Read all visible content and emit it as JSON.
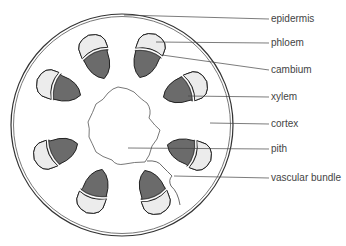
{
  "diagram": {
    "labels": [
      {
        "id": "epidermis",
        "text": "epidermis",
        "y": 19
      },
      {
        "id": "phloem",
        "text": "phloem",
        "y": 43
      },
      {
        "id": "cambium",
        "text": "cambium",
        "y": 70
      },
      {
        "id": "xylem",
        "text": "xylem",
        "y": 97
      },
      {
        "id": "cortex",
        "text": "cortex",
        "y": 124
      },
      {
        "id": "pith",
        "text": "pith",
        "y": 149
      },
      {
        "id": "vascular_bundle",
        "text": "vascular bundle",
        "y": 178
      }
    ],
    "colors": {
      "xylem": "#6b6b6b",
      "phloem": "#ececec",
      "outline": "#333333",
      "label_text": "#444444"
    }
  }
}
